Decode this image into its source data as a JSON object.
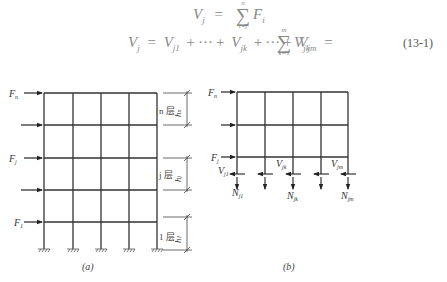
{
  "equations": {
    "eq1": {
      "lhs": "V",
      "lhs_sub": "j",
      "sum_top": "n",
      "sum_bottom": "i=j",
      "term": "F",
      "term_sub": "i"
    },
    "eq2": {
      "lhs": "V",
      "lhs_sub": "j",
      "terms": [
        "V",
        "V",
        "V"
      ],
      "term_subs": [
        "j1",
        "jk",
        "jm"
      ],
      "ellipsis": "···",
      "sum_top": "m",
      "sum_bottom": "k=1",
      "sum_term": "V",
      "sum_term_sub": "jk"
    },
    "number": "(13-1)"
  },
  "figure_a": {
    "caption": "(a)",
    "force_labels": [
      {
        "main": "F",
        "sub": "n"
      },
      {
        "main": "",
        "sub": ""
      },
      {
        "main": "F",
        "sub": "j"
      },
      {
        "main": "",
        "sub": ""
      },
      {
        "main": "F",
        "sub": "1"
      }
    ],
    "story_labels": [
      {
        "story": "n 层",
        "height": "h",
        "height_sub": "n"
      },
      {
        "story": "j 层",
        "height": "h",
        "height_sub": "j"
      },
      {
        "story": "1 层",
        "height": "h",
        "height_sub": "1"
      }
    ]
  },
  "figure_b": {
    "caption": "(b)",
    "force_labels": [
      {
        "main": "F",
        "sub": "n"
      },
      {
        "main": "",
        "sub": ""
      },
      {
        "main": "F",
        "sub": "j"
      }
    ],
    "shear_labels": [
      {
        "main": "V",
        "sub": "j1"
      },
      {
        "main": "V",
        "sub": "jk"
      },
      {
        "main": "V",
        "sub": "jm"
      }
    ],
    "axial_labels": [
      {
        "main": "N",
        "sub": "j1"
      },
      {
        "main": "N",
        "sub": "jk"
      },
      {
        "main": "N",
        "sub": "jm"
      }
    ]
  }
}
